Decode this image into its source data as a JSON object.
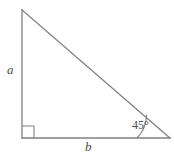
{
  "figure": {
    "kind": "geometry-diagram",
    "shape": "right-triangle",
    "background_color": "#ffffff",
    "stroke_color": "#808080",
    "text_color": "#4d4d4d",
    "labels": {
      "vertical_leg": "a",
      "horizontal_leg": "b",
      "angle": "45°"
    },
    "markers": {
      "right_angle": "right-angle-square",
      "angle_arc": "angle-arc"
    },
    "geometry": {
      "apex": [
        22,
        10
      ],
      "right_angle_vertex": [
        22,
        138
      ],
      "base_right_vertex": [
        170,
        138
      ],
      "right_angle_square_size": 12,
      "angle_arc_radius": 33
    }
  }
}
